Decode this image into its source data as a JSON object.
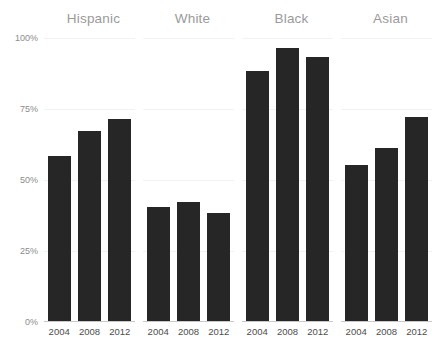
{
  "chart_data": {
    "type": "bar",
    "title": "",
    "subtitle": "",
    "xlabel": "",
    "ylabel": "",
    "ylim": [
      0,
      100
    ],
    "grid": true,
    "legend": "none",
    "facet_labels": [
      "Hispanic",
      "White",
      "Black",
      "Asian"
    ],
    "categories": [
      "2004",
      "2008",
      "2012"
    ],
    "y_ticks": [
      {
        "value": 0,
        "label": "0%"
      },
      {
        "value": 25,
        "label": "25%"
      },
      {
        "value": 50,
        "label": "50%"
      },
      {
        "value": 75,
        "label": "75%"
      },
      {
        "value": 100,
        "label": "100%"
      }
    ],
    "panels": [
      {
        "name": "Hispanic",
        "bars": [
          {
            "category": "2004",
            "value": 58
          },
          {
            "category": "2008",
            "value": 67
          },
          {
            "category": "2012",
            "value": 71
          }
        ]
      },
      {
        "name": "White",
        "bars": [
          {
            "category": "2004",
            "value": 40
          },
          {
            "category": "2008",
            "value": 42
          },
          {
            "category": "2012",
            "value": 38
          }
        ]
      },
      {
        "name": "Black",
        "bars": [
          {
            "category": "2004",
            "value": 88
          },
          {
            "category": "2008",
            "value": 96
          },
          {
            "category": "2012",
            "value": 93
          }
        ]
      },
      {
        "name": "Asian",
        "bars": [
          {
            "category": "2004",
            "value": 55
          },
          {
            "category": "2008",
            "value": 61
          },
          {
            "category": "2012",
            "value": 72
          }
        ]
      }
    ],
    "colors": {
      "bar": "#262626",
      "gridline": "#f2f2f2",
      "axis_line": "#c9c9c9",
      "facet_title": "#9a9a9a",
      "y_tick_label": "#8c8c8c",
      "x_tick_label": "#4d4d4d",
      "background": "#ffffff"
    }
  }
}
